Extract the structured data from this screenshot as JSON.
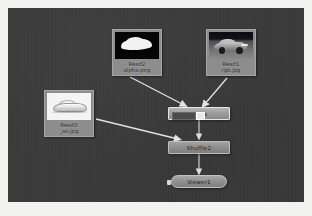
{
  "app": {
    "surface": "node-graph",
    "canvas_background": "#3a3a3a",
    "frame_background": "#f2f2f0"
  },
  "nodes": {
    "read2": {
      "name_line": "Read2",
      "file_line": "alpha.png",
      "label": "Read2\nalpha.png",
      "type": "Read",
      "thumbnail": "white-car-silhouette-on-black",
      "selected": false
    },
    "read1": {
      "name_line": "Read1",
      "file_line": "rgb.jpg",
      "label": "Read1\nrgb.jpg",
      "type": "Read",
      "thumbnail": "car-photo-dark-sky",
      "selected": false
    },
    "read3": {
      "name_line": "Read3",
      "file_line": "_ao.jpg",
      "label": "Read3\n_ao.jpg",
      "type": "Read",
      "thumbnail": "light-car-on-white",
      "selected": false
    },
    "merge": {
      "label": "alpha",
      "type": "ShuffleCopy",
      "selected": true
    },
    "shuffle2": {
      "label": "Shuffle2",
      "type": "Shuffle",
      "selected": false
    },
    "viewer1": {
      "label": "Viewer1",
      "type": "Viewer",
      "selected": false
    }
  },
  "connections": [
    {
      "from": "read2",
      "to": "merge"
    },
    {
      "from": "read1",
      "to": "merge"
    },
    {
      "from": "merge",
      "to": "shuffle2"
    },
    {
      "from": "read3",
      "to": "shuffle2"
    },
    {
      "from": "shuffle2",
      "to": "viewer1"
    }
  ],
  "colors": {
    "canvas": "#3a3a3a",
    "node_face": "#8f8f8f",
    "node_border": "#bdbdbd",
    "wire": "#e2e2e2",
    "label_text": "#1e1e1e"
  }
}
